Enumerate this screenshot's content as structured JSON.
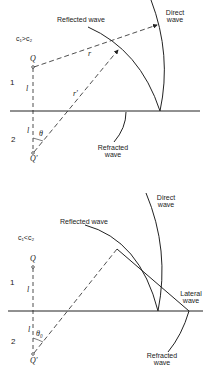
{
  "figure": {
    "top_panel": {
      "condition": "c₁>c₂",
      "medium_upper": "1",
      "medium_lower": "2",
      "source": "Q",
      "image_source": "Q'",
      "distance_upper": "l",
      "distance_lower": "l",
      "ray_direct": "r",
      "ray_reflected": "r'",
      "angle": "θ",
      "labels": {
        "reflected": "Reflected wave",
        "direct_line1": "Direct",
        "direct_line2": "wave",
        "refracted_line1": "Refracted",
        "refracted_line2": "wave"
      }
    },
    "bottom_panel": {
      "condition": "c₁<c₂",
      "medium_upper": "1",
      "medium_lower": "2",
      "source": "Q",
      "image_source": "Q'",
      "distance_upper": "l",
      "distance_lower": "l",
      "angle": "θ₀",
      "labels": {
        "reflected": "Reflected wave",
        "direct_line1": "Direct",
        "direct_line2": "wave",
        "lateral_line1": "Lateral",
        "lateral_line2": "wave",
        "refracted_line1": "Refracted",
        "refracted_line2": "wave"
      }
    },
    "colors": {
      "ink": "#222222",
      "background": "#ffffff"
    }
  }
}
